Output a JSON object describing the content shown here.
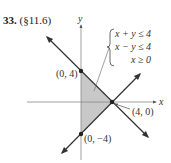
{
  "problem": {
    "number": "33.",
    "section": "(§11.6)"
  },
  "axes": {
    "x_label": "x",
    "y_label": "y"
  },
  "system": {
    "inequalities": [
      "x + y ≤ 4",
      "x − y ≤ 4",
      "x ≥ 0"
    ]
  },
  "points": [
    {
      "label": "(0, 4)",
      "x": 0,
      "y": 4
    },
    {
      "label": "(4, 0)",
      "x": 4,
      "y": 0
    },
    {
      "label": "(0, −4)",
      "x": 0,
      "y": -4
    }
  ],
  "region": {
    "description": "shaded triangle with vertices (0,4), (4,0), (0,-4)",
    "fill_color": "#c8c8c8"
  },
  "colors": {
    "line": "#333333",
    "axis": "#888888"
  }
}
